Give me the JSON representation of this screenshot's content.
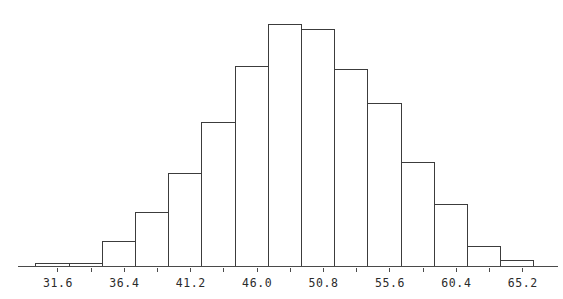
{
  "chart_data": {
    "type": "bar",
    "title": "",
    "subtitle": "",
    "xlabel": "",
    "ylabel": "",
    "grid": false,
    "legend": null,
    "bin_width": 2.4,
    "bin_edges": [
      30.0,
      32.4,
      34.8,
      37.2,
      39.6,
      42.0,
      44.4,
      46.8,
      49.2,
      51.6,
      54.0,
      56.4,
      58.8,
      61.2,
      63.6,
      66.0
    ],
    "categories": [
      "30.0-32.4",
      "32.4-34.8",
      "34.8-37.2",
      "37.2-39.6",
      "39.6-42.0",
      "42.0-44.4",
      "44.4-46.8",
      "46.8-49.2",
      "49.2-51.6",
      "51.6-54.0",
      "54.0-56.4",
      "56.4-58.8",
      "58.8-61.2",
      "61.2-63.6",
      "63.6-66.0"
    ],
    "values": [
      1,
      1,
      9,
      19,
      33,
      51,
      71,
      86,
      84,
      70,
      58,
      37,
      22,
      7,
      2
    ],
    "xlim": [
      29.0,
      67.6
    ],
    "ylim": [
      0,
      90
    ],
    "xticks": [
      31.6,
      36.4,
      41.2,
      46.0,
      50.8,
      55.6,
      60.4,
      65.2
    ],
    "xtick_labels": [
      "31.6",
      "36.4",
      "41.2",
      "46.0",
      "50.8",
      "55.6",
      "60.4",
      "65.2"
    ],
    "minor_xticks": [
      31.6,
      34.0,
      36.4,
      38.8,
      41.2,
      43.6,
      46.0,
      48.4,
      50.8,
      53.2,
      55.6,
      58.0,
      60.4,
      62.8,
      65.2
    ],
    "yticks": [],
    "ytick_labels": []
  },
  "style": {
    "bar_stroke_color": "#3c3c3c",
    "bar_fill_color": "#ffffff",
    "axis_color": "#4a4a4a",
    "label_color": "#2b2b2b",
    "background_color": "#ffffff"
  }
}
